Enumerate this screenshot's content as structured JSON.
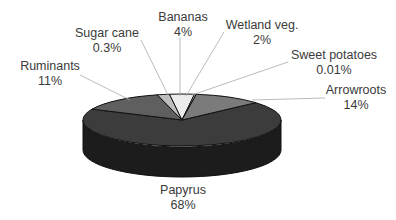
{
  "chart_data": {
    "type": "pie",
    "style": "3d",
    "title": "",
    "categories": [
      "Papyrus",
      "Arrowroots",
      "Sweet potatoes",
      "Wetland veg.",
      "Bananas",
      "Sugar cane",
      "Ruminants"
    ],
    "values": [
      68,
      14,
      0.01,
      2,
      4,
      0.3,
      11
    ],
    "value_labels": [
      "68%",
      "14%",
      "0.01%",
      "2%",
      "4%",
      "0.3%",
      "11%"
    ],
    "colors": [
      "#3c3c3c",
      "#5f5f5f",
      "#9a9a9a",
      "#bdbdbd",
      "#ebebeb",
      "#d0d0d0",
      "#7b7b7b"
    ],
    "legend": "none",
    "labels_position": "outside with leader lines"
  },
  "labels": {
    "papyrus": {
      "name": "Papyrus",
      "value": "68%"
    },
    "arrowroots": {
      "name": "Arrowroots",
      "value": "14%"
    },
    "sweet_potatoes": {
      "name": "Sweet potatoes",
      "value": "0.01%"
    },
    "wetland_veg": {
      "name": "Wetland veg.",
      "value": "2%"
    },
    "bananas": {
      "name": "Bananas",
      "value": "4%"
    },
    "sugar_cane": {
      "name": "Sugar cane",
      "value": "0.3%"
    },
    "ruminants": {
      "name": "Ruminants",
      "value": "11%"
    }
  }
}
